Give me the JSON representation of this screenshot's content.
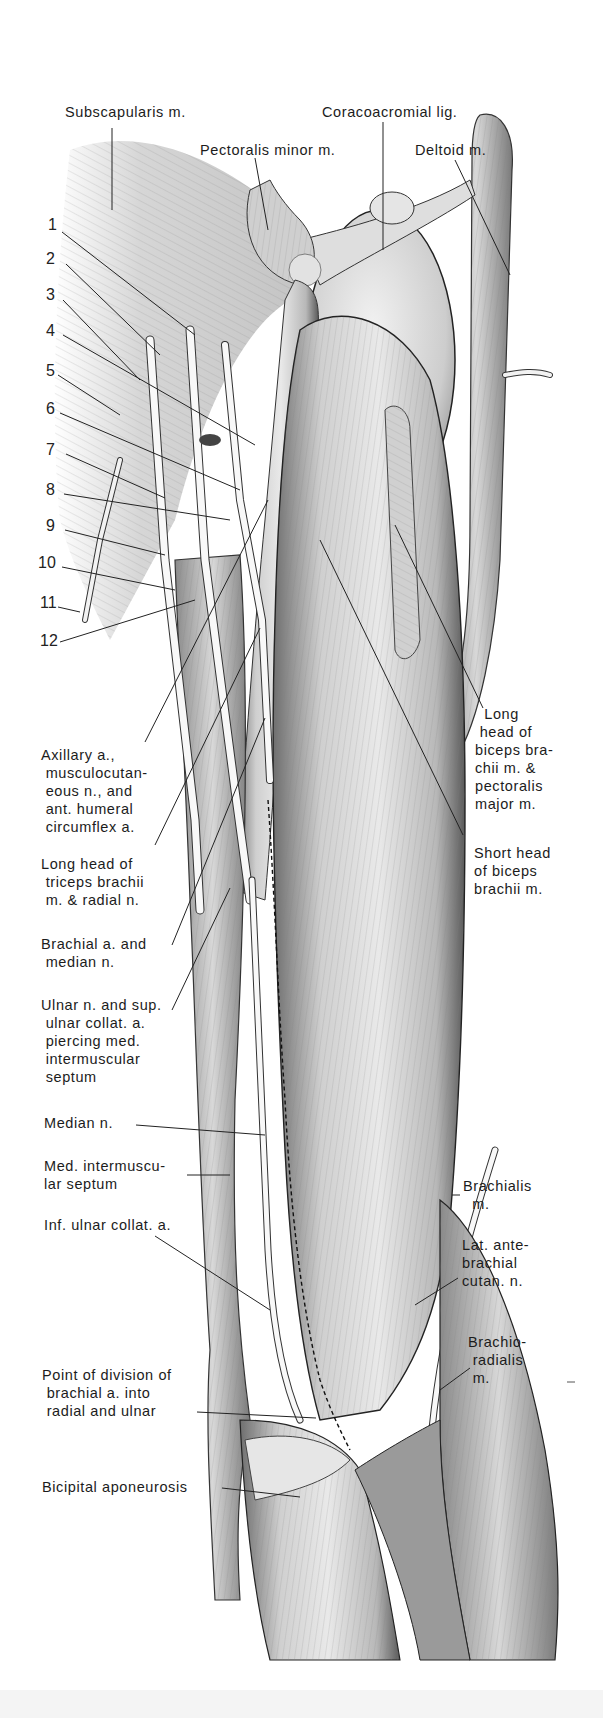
{
  "figure": {
    "background_color": "#ffffff",
    "ink_color": "#1c1c1c"
  },
  "top_labels": {
    "subscapularis": "Subscapularis m.",
    "coracoacromial": "Coracoacromial lig.",
    "pectoralis_minor": "Pectoralis minor m.",
    "deltoid": "Deltoid m."
  },
  "numbers": [
    "1",
    "2",
    "3",
    "4",
    "5",
    "6",
    "7",
    "8",
    "9",
    "10",
    "11",
    "12"
  ],
  "left_labels": {
    "axillary": "Axillary a.,\n musculocutan-\n eous n., and\n ant. humeral\n circumflex a.",
    "long_head_triceps": "Long head of\n triceps brachii\n m. & radial n.",
    "brachial_median": "Brachial a. and\n median n.",
    "ulnar": "Ulnar n. and sup.\n ulnar collat. a.\n piercing med.\n intermuscular\n septum",
    "median": "Median n.",
    "med_intermuscular": "Med. intermuscu-\nlar septum",
    "inf_ulnar": "Inf. ulnar collat. a.",
    "point_division": "Point of division of\n brachial a. into\n radial and ulnar",
    "bicipital": "Bicipital aponeurosis"
  },
  "right_labels": {
    "long_head_biceps": "  Long\n head of\nbiceps bra-\nchii m. &\npectoralis\nmajor m.",
    "short_head_biceps": "Short head\nof biceps\nbrachii m.",
    "brachialis": "Brachialis\n  m.",
    "lat_antebrachial": "Lat. ante-\nbrachial\ncutan. n.",
    "brachioradialis": "Brachio-\n radialis\n m."
  }
}
